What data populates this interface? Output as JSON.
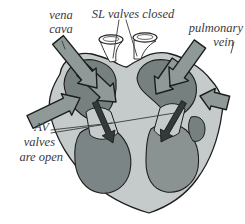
{
  "figure": "heart blood-flow diagram",
  "colors": {
    "background": "#ffffff",
    "heart_wall": "#c5cbca",
    "atrium": "#76807f",
    "ventricle_left": "#7b8585",
    "ventricle_right": "#8a9392",
    "flow_arrow": "#8f9998",
    "dark_arrow": "#343a3a",
    "outline": "#1d1d1d",
    "label_text": "#3a3a3a"
  },
  "labels": {
    "vena_cava": {
      "line1": "vena",
      "line2": "cava"
    },
    "sl_valves": "SL valves closed",
    "pulmonary_vein": {
      "line1": "pulmonary",
      "line2": "vein"
    },
    "av_valves": {
      "line1": "AV",
      "line2": "valves",
      "line3": "are open"
    }
  }
}
